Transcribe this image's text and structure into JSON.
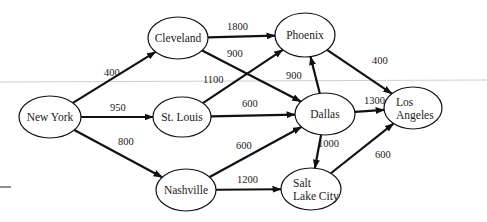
{
  "diagram": {
    "type": "directed-weighted-graph",
    "nodes": [
      {
        "id": "new-york",
        "label": [
          "New York"
        ],
        "cx": 50,
        "cy": 117,
        "rx": 31,
        "ry": 21
      },
      {
        "id": "cleveland",
        "label": [
          "Cleveland"
        ],
        "cx": 178,
        "cy": 38,
        "rx": 30,
        "ry": 21
      },
      {
        "id": "phoenix",
        "label": [
          "Phoenix"
        ],
        "cx": 305,
        "cy": 35,
        "rx": 30,
        "ry": 22
      },
      {
        "id": "st-louis",
        "label": [
          "St. Louis"
        ],
        "cx": 182,
        "cy": 117,
        "rx": 29,
        "ry": 20
      },
      {
        "id": "dallas",
        "label": [
          "Dallas"
        ],
        "cx": 325,
        "cy": 114,
        "rx": 30,
        "ry": 21
      },
      {
        "id": "los-angeles",
        "label": [
          "Los",
          "Angeles"
        ],
        "cx": 413,
        "cy": 108,
        "rx": 29,
        "ry": 21
      },
      {
        "id": "nashville",
        "label": [
          "Nashville"
        ],
        "cx": 186,
        "cy": 190,
        "rx": 30,
        "ry": 21
      },
      {
        "id": "salt-lake-city",
        "label": [
          "Salt",
          "Lake City"
        ],
        "cx": 311,
        "cy": 189,
        "rx": 30,
        "ry": 21
      }
    ],
    "edges": [
      {
        "from": "new-york",
        "to": "cleveland",
        "weight": "400",
        "lx": 104,
        "ly": 76
      },
      {
        "from": "new-york",
        "to": "st-louis",
        "weight": "950",
        "lx": 110,
        "ly": 111
      },
      {
        "from": "new-york",
        "to": "nashville",
        "weight": "800",
        "lx": 118,
        "ly": 145
      },
      {
        "from": "cleveland",
        "to": "phoenix",
        "weight": "1800",
        "lx": 227,
        "ly": 30
      },
      {
        "from": "cleveland",
        "to": "dallas",
        "weight": "900",
        "lx": 227,
        "ly": 57
      },
      {
        "from": "st-louis",
        "to": "phoenix",
        "weight": "1100",
        "lx": 203,
        "ly": 83
      },
      {
        "from": "st-louis",
        "to": "dallas",
        "weight": "600",
        "lx": 242,
        "ly": 107
      },
      {
        "from": "dallas",
        "to": "phoenix",
        "weight": "900",
        "lx": 286,
        "ly": 79
      },
      {
        "from": "phoenix",
        "to": "los-angeles",
        "weight": "400",
        "lx": 372,
        "ly": 64
      },
      {
        "from": "dallas",
        "to": "los-angeles",
        "weight": "1300",
        "lx": 364,
        "ly": 104
      },
      {
        "from": "nashville",
        "to": "dallas",
        "weight": "600",
        "lx": 236,
        "ly": 149
      },
      {
        "from": "dallas",
        "to": "salt-lake-city",
        "weight": "1000",
        "lx": 318,
        "ly": 147
      },
      {
        "from": "nashville",
        "to": "salt-lake-city",
        "weight": "1200",
        "lx": 237,
        "ly": 183
      },
      {
        "from": "salt-lake-city",
        "to": "los-angeles",
        "weight": "600",
        "lx": 375,
        "ly": 158
      }
    ]
  }
}
